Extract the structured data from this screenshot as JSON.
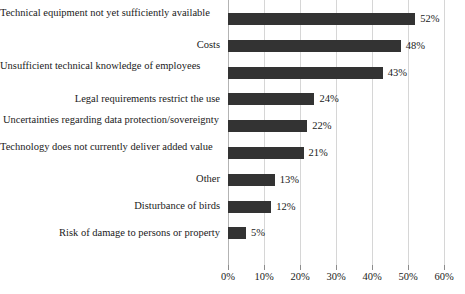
{
  "chart_data": {
    "type": "bar",
    "orientation": "horizontal",
    "title": "",
    "subtitle": "",
    "xlabel": "",
    "ylabel": "",
    "xlim": [
      0,
      60
    ],
    "grid": true,
    "legend": null,
    "xtick_labels": [
      "0%",
      "10%",
      "20%",
      "30%",
      "40%",
      "50%",
      "60%"
    ],
    "xticks": [
      0,
      10,
      20,
      30,
      40,
      50,
      60
    ],
    "bar_color": "#333333",
    "gridline_color": "#d6d6d6",
    "categories": [
      "Technical equipment not yet sufficiently available",
      "Costs",
      "Unsufficient technical knowledge of employees",
      "Legal requirements restrict the use",
      "Uncertainties regarding data protection/sovereignty",
      "Technology does not currently deliver added value",
      "Other",
      "Disturbance of birds",
      "Risk of damage to persons or property"
    ],
    "values": [
      52,
      48,
      43,
      24,
      22,
      21,
      13,
      12,
      5
    ],
    "data_labels": [
      "52%",
      "48%",
      "43%",
      "24%",
      "22%",
      "21%",
      "13%",
      "12%",
      "5%"
    ]
  },
  "rows": [
    {
      "label": "Technical equipment not yet sufficiently available",
      "value": 52,
      "data_label": "52%",
      "align": "wrap-left"
    },
    {
      "label": "Costs",
      "value": 48,
      "data_label": "48%",
      "align": "right"
    },
    {
      "label": "Unsufficient technical knowledge of employees",
      "value": 43,
      "data_label": "43%",
      "align": "wrap-left"
    },
    {
      "label": "Legal requirements restrict the use",
      "value": 24,
      "data_label": "24%",
      "align": "right"
    },
    {
      "label": "Uncertainties regarding data protection/sovereignty",
      "value": 22,
      "data_label": "22%",
      "align": "wrap-center"
    },
    {
      "label": "Technology does not currently deliver added value",
      "value": 21,
      "data_label": "21%",
      "align": "wrap-left"
    },
    {
      "label": "Other",
      "value": 13,
      "data_label": "13%",
      "align": "right"
    },
    {
      "label": "Disturbance of birds",
      "value": 12,
      "data_label": "12%",
      "align": "right"
    },
    {
      "label": "Risk of damage to persons or property",
      "value": 5,
      "data_label": "5%",
      "align": "right"
    }
  ]
}
